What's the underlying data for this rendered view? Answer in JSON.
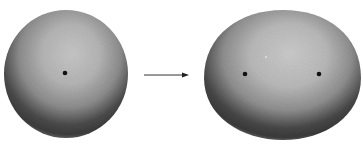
{
  "figure": {
    "panels": [
      {
        "id": "before",
        "shape": "sphere",
        "cx": 66,
        "cy": 74,
        "rx": 62,
        "ry": 64,
        "dots": [
          {
            "x": 65,
            "y": 73
          }
        ]
      },
      {
        "id": "after",
        "shape": "ellipsoid",
        "cx": 283,
        "cy": 75,
        "rx": 78,
        "ry": 65,
        "dots": [
          {
            "x": 245,
            "y": 74
          },
          {
            "x": 319,
            "y": 74
          }
        ]
      }
    ],
    "arrow": {
      "x1": 144,
      "y1": 75,
      "x2": 188,
      "y2": 75,
      "direction": "right"
    },
    "colors": {
      "highlight": "#c4c4c4",
      "midtone": "#9a9a9a",
      "shadow": "#3e3e3e",
      "rim": "#7a7a7a",
      "dot": "#111111",
      "arrow": "#333333",
      "background": "#ffffff"
    }
  }
}
